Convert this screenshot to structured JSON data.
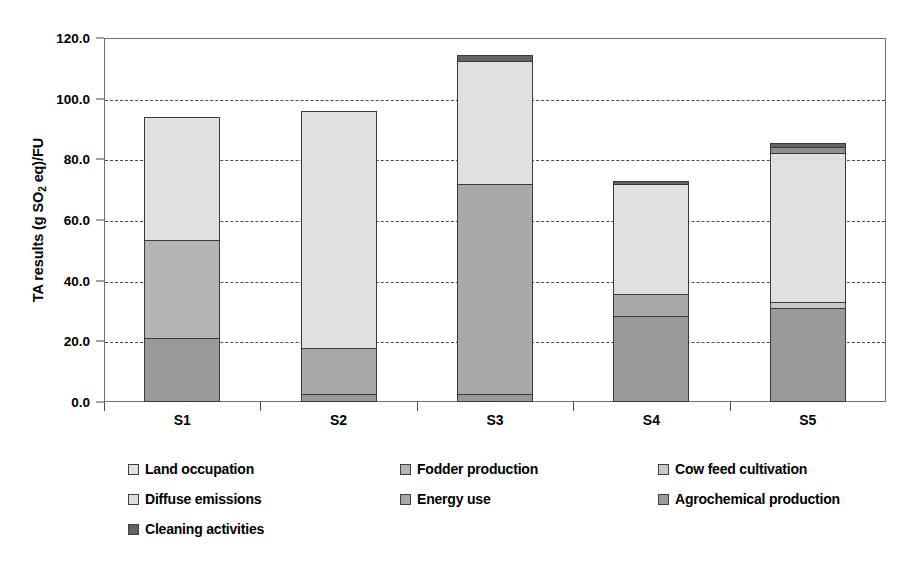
{
  "chart_data": {
    "type": "bar",
    "subtype": "stacked-bar",
    "title": "",
    "xlabel": "",
    "ylabel": "TA results (g SO2 eq)/FU",
    "ylabel_parts": {
      "pre": "TA results (g SO",
      "sub": "2",
      "post": " eq)/FU"
    },
    "categories": [
      "S1",
      "S2",
      "S3",
      "S4",
      "S5"
    ],
    "ylim": [
      0,
      120
    ],
    "ytick_step": 20,
    "ytick_labels": [
      "0.0",
      "20.0",
      "40.0",
      "60.0",
      "80.0",
      "100.0",
      "120.0"
    ],
    "ytick_values": [
      0,
      20,
      40,
      60,
      80,
      100,
      120
    ],
    "grid": "horizontal-dashed",
    "legend_position": "below-3-columns",
    "series": [
      {
        "name": "Land occupation",
        "color": "#e0e0e0",
        "values": [
          40.5,
          78.2,
          40.5,
          36.5,
          49.0
        ]
      },
      {
        "name": "Fodder production",
        "color": "#b4b4b4",
        "values": [
          32.5,
          0.0,
          0.0,
          0.0,
          0.0
        ]
      },
      {
        "name": "Cow feed cultivation",
        "color": "#c9c9c9",
        "values": [
          0.0,
          0.0,
          0.0,
          0.0,
          2.0
        ]
      },
      {
        "name": "Diffuse emissions",
        "color": "#dcdcdc",
        "values": [
          0.0,
          0.0,
          0.0,
          0.0,
          0.0
        ]
      },
      {
        "name": "Energy use",
        "color": "#a9a9a9",
        "values": [
          0.0,
          15.3,
          69.5,
          7.0,
          0.0
        ]
      },
      {
        "name": "Agrochemical production",
        "color": "#9a9a9a",
        "values": [
          21.0,
          2.5,
          2.5,
          28.5,
          31.0
        ]
      },
      {
        "name": "Cleaning activities",
        "color": "#636363",
        "values": [
          0.0,
          0.0,
          2.0,
          1.0,
          3.5
        ]
      }
    ],
    "bar_totals": [
      94.0,
      96.0,
      114.5,
      73.0,
      85.5
    ],
    "stacks": [
      {
        "category": "S1",
        "total": 94.0,
        "segments": [
          {
            "label": "Agrochemical production",
            "from": 0.0,
            "to": 21.0,
            "color": "#9a9a9a"
          },
          {
            "label": "Fodder production",
            "from": 21.0,
            "to": 53.5,
            "color": "#b4b4b4"
          },
          {
            "label": "Land occupation",
            "from": 53.5,
            "to": 94.0,
            "color": "#e0e0e0"
          }
        ]
      },
      {
        "category": "S2",
        "total": 96.0,
        "segments": [
          {
            "label": "Agrochemical production",
            "from": 0.0,
            "to": 2.5,
            "color": "#9a9a9a"
          },
          {
            "label": "Energy use",
            "from": 2.5,
            "to": 17.8,
            "color": "#a9a9a9"
          },
          {
            "label": "Land occupation",
            "from": 17.8,
            "to": 96.0,
            "color": "#e0e0e0"
          }
        ]
      },
      {
        "category": "S3",
        "total": 114.5,
        "segments": [
          {
            "label": "Agrochemical production",
            "from": 0.0,
            "to": 2.5,
            "color": "#9a9a9a"
          },
          {
            "label": "Energy use",
            "from": 2.5,
            "to": 72.0,
            "color": "#a9a9a9"
          },
          {
            "label": "Land occupation",
            "from": 72.0,
            "to": 112.5,
            "color": "#e0e0e0"
          },
          {
            "label": "Cleaning activities",
            "from": 112.5,
            "to": 114.5,
            "color": "#636363"
          }
        ]
      },
      {
        "category": "S4",
        "total": 73.0,
        "segments": [
          {
            "label": "Agrochemical production",
            "from": 0.0,
            "to": 28.5,
            "color": "#9a9a9a"
          },
          {
            "label": "Energy use",
            "from": 28.5,
            "to": 35.5,
            "color": "#a9a9a9"
          },
          {
            "label": "Land occupation",
            "from": 35.5,
            "to": 72.0,
            "color": "#e0e0e0"
          },
          {
            "label": "Cleaning activities",
            "from": 72.0,
            "to": 73.0,
            "color": "#636363"
          }
        ]
      },
      {
        "category": "S5",
        "total": 85.5,
        "segments": [
          {
            "label": "Agrochemical production",
            "from": 0.0,
            "to": 31.0,
            "color": "#9a9a9a"
          },
          {
            "label": "Cow feed cultivation",
            "from": 31.0,
            "to": 33.0,
            "color": "#c9c9c9"
          },
          {
            "label": "Land occupation",
            "from": 33.0,
            "to": 82.0,
            "color": "#e0e0e0"
          },
          {
            "label": "Diffuse emissions",
            "from": 82.0,
            "to": 84.0,
            "color": "#8f8f8f"
          },
          {
            "label": "Cleaning activities",
            "from": 84.0,
            "to": 85.5,
            "color": "#636363"
          }
        ]
      }
    ],
    "legend": [
      {
        "label": "Land occupation",
        "color": "#e0e0e0",
        "col": 0,
        "row": 0
      },
      {
        "label": "Fodder production",
        "color": "#b4b4b4",
        "col": 1,
        "row": 0
      },
      {
        "label": "Cow feed cultivation",
        "color": "#c9c9c9",
        "col": 2,
        "row": 0
      },
      {
        "label": "Diffuse emissions",
        "color": "#dcdcdc",
        "col": 0,
        "row": 1
      },
      {
        "label": "Energy use",
        "color": "#a9a9a9",
        "col": 1,
        "row": 1
      },
      {
        "label": "Agrochemical production",
        "color": "#9a9a9a",
        "col": 2,
        "row": 1
      },
      {
        "label": "Cleaning activities",
        "color": "#636363",
        "col": 0,
        "row": 2
      }
    ],
    "colors": {
      "axis": "#6f6f6f",
      "grid": "#4a4a4a",
      "bar_outline": "#3a3a3a",
      "text": "#000000",
      "background": "#ffffff"
    }
  }
}
